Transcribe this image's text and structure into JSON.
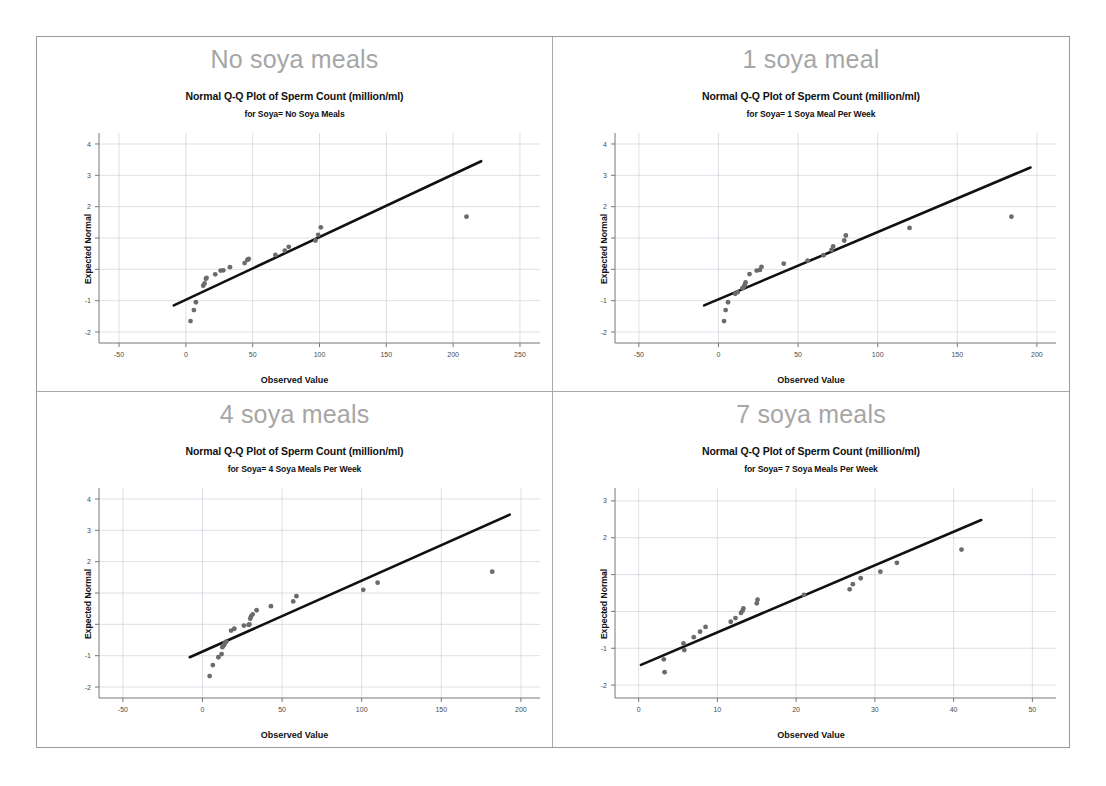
{
  "figure": {
    "background_color": "#ffffff",
    "frame_border_color": "#9a9a9a",
    "panel_border_color": "#a8a8a8",
    "point_color": "#6b6b6b",
    "line_color": "#111111",
    "grid_color": "#c9c9d6",
    "panel_title_color": "#a6a6a6"
  },
  "panels": [
    {
      "panel_title": "No soya meals",
      "chart_data": {
        "type": "scatter",
        "title": "Normal Q-Q Plot of Sperm Count (million/ml)",
        "subtitle": "for Soya= No Soya Meals",
        "xlabel": "Observed Value",
        "ylabel": "Expected Normal",
        "xlim": [
          -65,
          265
        ],
        "ylim": [
          -2.35,
          4.35
        ],
        "xticks": [
          -50,
          0,
          50,
          100,
          150,
          200,
          250
        ],
        "yticks": [
          4,
          3,
          2,
          1,
          0,
          -1,
          -2
        ],
        "grid": true,
        "reference_line": {
          "x": [
            -9,
            221
          ],
          "y": [
            -1.15,
            3.45
          ]
        },
        "series": [
          {
            "name": "Sperm Count",
            "x": [
              3.5,
              6.0,
              7.5,
              13.0,
              14.0,
              15.0,
              15.5,
              22.0,
              26.0,
              28.0,
              33.0,
              44.0,
              46.0,
              47.0,
              67.0,
              74.0,
              77.0,
              97.0,
              99.0,
              101.0,
              210.0
            ],
            "y": [
              -1.65,
              -1.3,
              -1.05,
              -0.52,
              -0.45,
              -0.3,
              -0.27,
              -0.16,
              -0.04,
              -0.03,
              0.07,
              0.2,
              0.3,
              0.33,
              0.46,
              0.6,
              0.72,
              0.92,
              1.1,
              1.34,
              1.68
            ]
          }
        ]
      }
    },
    {
      "panel_title": "1 soya meal",
      "chart_data": {
        "type": "scatter",
        "title": "Normal Q-Q Plot of Sperm Count (million/ml)",
        "subtitle": "for Soya= 1 Soya Meal Per Week",
        "xlabel": "Observed Value",
        "ylabel": "Expected Normal",
        "xlim": [
          -65,
          212
        ],
        "ylim": [
          -2.35,
          4.35
        ],
        "xticks": [
          -50,
          0,
          50,
          100,
          150,
          200
        ],
        "yticks": [
          4,
          3,
          2,
          1,
          0,
          -1,
          -2
        ],
        "grid": true,
        "reference_line": {
          "x": [
            -9,
            196
          ],
          "y": [
            -1.15,
            3.25
          ]
        },
        "series": [
          {
            "name": "Sperm Count",
            "x": [
              3.5,
              4.5,
              6.0,
              10.5,
              12.0,
              15.0,
              16.0,
              16.5,
              17.0,
              19.5,
              24.0,
              26.0,
              27.0,
              41.0,
              56.0,
              66.0,
              71.0,
              72.0,
              79.0,
              80.0,
              120.0,
              184.0
            ],
            "y": [
              -1.65,
              -1.3,
              -1.05,
              -0.78,
              -0.73,
              -0.6,
              -0.55,
              -0.5,
              -0.42,
              -0.15,
              -0.04,
              -0.02,
              0.08,
              0.18,
              0.28,
              0.45,
              0.62,
              0.73,
              0.92,
              1.08,
              1.32,
              1.68
            ]
          }
        ]
      }
    },
    {
      "panel_title": "4 soya meals",
      "chart_data": {
        "type": "scatter",
        "title": "Normal Q-Q Plot of Sperm Count (million/ml)",
        "subtitle": "for Soya= 4 Soya Meals Per Week",
        "xlabel": "Observed Value",
        "ylabel": "Expected Normal",
        "xlim": [
          -65,
          212
        ],
        "ylim": [
          -2.35,
          4.35
        ],
        "xticks": [
          -50,
          0,
          50,
          100,
          150,
          200
        ],
        "yticks": [
          4,
          3,
          2,
          1,
          0,
          -1,
          -2
        ],
        "grid": true,
        "reference_line": {
          "x": [
            -8,
            193
          ],
          "y": [
            -1.05,
            3.5
          ]
        },
        "series": [
          {
            "name": "Sperm Count",
            "x": [
              4.5,
              6.5,
              10.0,
              12.0,
              12.5,
              13.5,
              14.0,
              15.0,
              18.0,
              20.0,
              26.0,
              29.0,
              29.5,
              30.0,
              30.5,
              31.5,
              34.0,
              43.0,
              57.0,
              59.0,
              101.0,
              110.0,
              182.0
            ],
            "y": [
              -1.65,
              -1.3,
              -1.05,
              -0.95,
              -0.73,
              -0.67,
              -0.6,
              -0.55,
              -0.2,
              -0.14,
              -0.04,
              -0.02,
              0.0,
              0.18,
              0.25,
              0.32,
              0.45,
              0.58,
              0.73,
              0.9,
              1.1,
              1.33,
              1.68
            ]
          }
        ]
      }
    },
    {
      "panel_title": "7 soya meals",
      "chart_data": {
        "type": "scatter",
        "title": "Normal Q-Q Plot of Sperm Count (million/ml)",
        "subtitle": "for Soya= 7 Soya Meals Per Week",
        "xlabel": "Observed Value",
        "ylabel": "Expected Normal",
        "xlim": [
          -3,
          53
        ],
        "ylim": [
          -2.35,
          3.35
        ],
        "xticks": [
          0,
          10,
          20,
          30,
          40,
          50
        ],
        "yticks": [
          3,
          2,
          1,
          0,
          -1,
          -2
        ],
        "grid": true,
        "reference_line": {
          "x": [
            0.3,
            43.5
          ],
          "y": [
            -1.45,
            2.48
          ]
        },
        "series": [
          {
            "name": "Sperm Count",
            "x": [
              3.2,
              3.3,
              5.7,
              5.8,
              7.0,
              7.8,
              8.5,
              11.7,
              12.3,
              13.0,
              13.2,
              13.3,
              15.0,
              15.1,
              21.0,
              26.8,
              27.2,
              28.2,
              30.7,
              32.8,
              41.0
            ],
            "y": [
              -1.3,
              -1.65,
              -0.87,
              -1.05,
              -0.7,
              -0.55,
              -0.42,
              -0.28,
              -0.18,
              -0.04,
              0.02,
              0.08,
              0.22,
              0.32,
              0.45,
              0.6,
              0.74,
              0.9,
              1.08,
              1.32,
              1.68
            ]
          }
        ]
      }
    }
  ]
}
